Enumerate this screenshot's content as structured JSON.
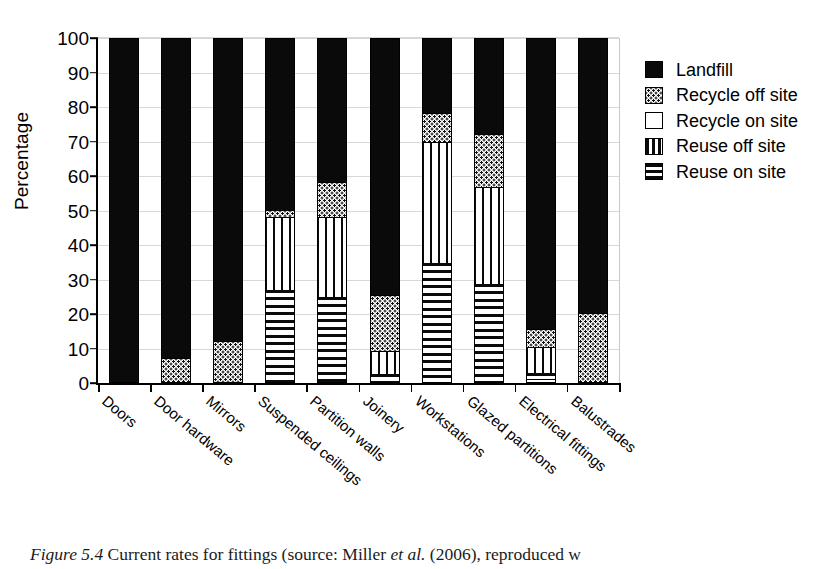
{
  "figure": {
    "caption_prefix": "Figure 5.4",
    "caption_rest": " Current rates for fittings (source: Miller ",
    "caption_italic": "et al.",
    "caption_tail": " (2006), reproduced w"
  },
  "axes": {
    "ylabel": "Percentage",
    "yticks": [
      "0",
      "10",
      "20",
      "30",
      "40",
      "50",
      "60",
      "70",
      "80",
      "90",
      "100"
    ]
  },
  "legend": {
    "items": [
      {
        "label": "Landfill",
        "key": "landfill",
        "color": "#0a0a0a",
        "pattern": "solid-black"
      },
      {
        "label": "Recycle off site",
        "key": "recycle_off",
        "color": "#ffffff",
        "pattern": "dotted"
      },
      {
        "label": "Recycle on site",
        "key": "recycle_on",
        "color": "#ffffff",
        "pattern": "blank"
      },
      {
        "label": "Reuse off site",
        "key": "reuse_off",
        "color": "#ffffff",
        "pattern": "vertical-stripes"
      },
      {
        "label": "Reuse on site",
        "key": "reuse_on",
        "color": "#ffffff",
        "pattern": "horizontal-stripes"
      }
    ]
  },
  "chart_data": {
    "type": "bar",
    "subtype": "stacked-bar-100-percent",
    "title": "",
    "xlabel": "",
    "ylabel": "Percentage",
    "ylim": [
      0,
      100
    ],
    "ytick_step": 10,
    "grid": true,
    "legend_position": "right",
    "categories": [
      "Doors",
      "Door hardware",
      "Mirrors",
      "Suspended ceilings",
      "Partition walls",
      "Joinery",
      "Workstations",
      "Glazed partitions",
      "Electrical fittings",
      "Balustrades"
    ],
    "series": [
      {
        "name": "Reuse on site",
        "values": [
          0,
          0,
          0,
          27,
          25,
          2.5,
          35,
          29,
          1.5,
          0
        ]
      },
      {
        "name": "Reuse off site",
        "values": [
          0,
          0,
          0,
          21,
          23,
          6.5,
          35,
          28,
          7.5,
          0
        ]
      },
      {
        "name": "Recycle on site",
        "values": [
          0,
          0,
          0,
          0,
          0,
          0,
          0,
          0,
          1,
          0
        ]
      },
      {
        "name": "Recycle off site",
        "values": [
          0,
          7,
          12,
          2,
          10,
          16,
          8,
          15,
          5,
          20
        ]
      },
      {
        "name": "Landfill",
        "values": [
          100,
          93,
          88,
          50,
          42,
          75,
          22,
          28,
          85,
          80
        ]
      }
    ],
    "stack_order_bottom_to_top": [
      "Recycle on site",
      "Reuse on site",
      "Reuse off site",
      "Recycle off site",
      "Landfill"
    ],
    "bars": [
      {
        "category": "Doors",
        "segments": [
          {
            "series": "Landfill",
            "from": 0,
            "to": 100
          }
        ]
      },
      {
        "category": "Door hardware",
        "segments": [
          {
            "series": "Recycle off site",
            "from": 0,
            "to": 7
          },
          {
            "series": "Landfill",
            "from": 7,
            "to": 100
          }
        ]
      },
      {
        "category": "Mirrors",
        "segments": [
          {
            "series": "Recycle off site",
            "from": 0,
            "to": 12
          },
          {
            "series": "Landfill",
            "from": 12,
            "to": 100
          }
        ]
      },
      {
        "category": "Suspended ceilings",
        "segments": [
          {
            "series": "Reuse on site",
            "from": 0,
            "to": 27
          },
          {
            "series": "Reuse off site",
            "from": 27,
            "to": 48
          },
          {
            "series": "Recycle off site",
            "from": 48,
            "to": 50
          },
          {
            "series": "Landfill",
            "from": 50,
            "to": 100
          }
        ]
      },
      {
        "category": "Partition walls",
        "segments": [
          {
            "series": "Reuse on site",
            "from": 0,
            "to": 25
          },
          {
            "series": "Reuse off site",
            "from": 25,
            "to": 48
          },
          {
            "series": "Recycle off site",
            "from": 48,
            "to": 58
          },
          {
            "series": "Landfill",
            "from": 58,
            "to": 100
          }
        ]
      },
      {
        "category": "Joinery",
        "segments": [
          {
            "series": "Reuse on site",
            "from": 0,
            "to": 2.5
          },
          {
            "series": "Reuse off site",
            "from": 2.5,
            "to": 9
          },
          {
            "series": "Recycle off site",
            "from": 9,
            "to": 25
          },
          {
            "series": "Landfill",
            "from": 25,
            "to": 100
          }
        ]
      },
      {
        "category": "Workstations",
        "segments": [
          {
            "series": "Reuse on site",
            "from": 0,
            "to": 35
          },
          {
            "series": "Reuse off site",
            "from": 35,
            "to": 70
          },
          {
            "series": "Recycle off site",
            "from": 70,
            "to": 78
          },
          {
            "series": "Landfill",
            "from": 78,
            "to": 100
          }
        ]
      },
      {
        "category": "Glazed partitions",
        "segments": [
          {
            "series": "Reuse on site",
            "from": 0,
            "to": 29
          },
          {
            "series": "Reuse off site",
            "from": 29,
            "to": 57
          },
          {
            "series": "Recycle off site",
            "from": 57,
            "to": 72
          },
          {
            "series": "Landfill",
            "from": 72,
            "to": 100
          }
        ]
      },
      {
        "category": "Electrical fittings",
        "segments": [
          {
            "series": "Recycle on site",
            "from": 0,
            "to": 1
          },
          {
            "series": "Reuse on site",
            "from": 1,
            "to": 2.5
          },
          {
            "series": "Reuse off site",
            "from": 2.5,
            "to": 10
          },
          {
            "series": "Recycle off site",
            "from": 10,
            "to": 15
          },
          {
            "series": "Landfill",
            "from": 15,
            "to": 100
          }
        ]
      },
      {
        "category": "Balustrades",
        "segments": [
          {
            "series": "Recycle off site",
            "from": 0,
            "to": 20
          },
          {
            "series": "Landfill",
            "from": 20,
            "to": 100
          }
        ]
      }
    ]
  }
}
